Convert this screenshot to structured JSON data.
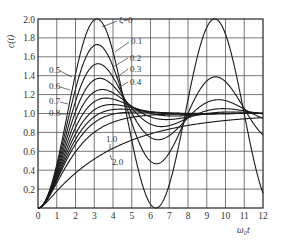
{
  "chart_data": {
    "type": "line",
    "title": "",
    "xlabel": "ω₀t",
    "ylabel": "c(t)",
    "xlim": [
      0,
      12
    ],
    "ylim": [
      0,
      2.0
    ],
    "grid": true,
    "xticks": [
      "0",
      "1",
      "2",
      "3",
      "4",
      "5",
      "6",
      "7",
      "8",
      "9",
      "10",
      "11",
      "12"
    ],
    "yticks": [
      "0.2",
      "0.4",
      "0.6",
      "0.8",
      "1.0",
      "1.2",
      "1.4",
      "1.6",
      "1.8",
      "2.0"
    ],
    "legend_position": "inline labels",
    "formula": "c(t) = 1 - e^(-ξω₀t)/sqrt(1-ξ²) · sin(ω₀·sqrt(1-ξ²)·t + arccos ξ)",
    "series": [
      {
        "name": "ξ=0",
        "zeta": 0.0,
        "label": "ξ=0"
      },
      {
        "name": "0.1",
        "zeta": 0.1,
        "label": "0.1"
      },
      {
        "name": "0.2",
        "zeta": 0.2,
        "label": "0.2"
      },
      {
        "name": "0.3",
        "zeta": 0.3,
        "label": "0.3"
      },
      {
        "name": "0.4",
        "zeta": 0.4,
        "label": "0.4"
      },
      {
        "name": "0.5",
        "zeta": 0.5,
        "label": "0.5"
      },
      {
        "name": "0.6",
        "zeta": 0.6,
        "label": "0.6"
      },
      {
        "name": "0.7",
        "zeta": 0.7,
        "label": "0.7"
      },
      {
        "name": "0.8",
        "zeta": 0.8,
        "label": "0.8"
      },
      {
        "name": "1.0",
        "zeta": 1.0,
        "label": "1.0"
      },
      {
        "name": "2.0",
        "zeta": 2.0,
        "label": "2.0"
      }
    ],
    "key_points": {
      "zeta_0_peak": [
        3.14,
        2.0
      ],
      "zeta_0_min": [
        6.28,
        0.0
      ],
      "zeta_0_second_peak": [
        9.42,
        2.0
      ],
      "zeta_0.1_peak": [
        3.16,
        1.73
      ],
      "zeta_0.2_peak": [
        3.21,
        1.53
      ],
      "zeta_0.3_peak": [
        3.29,
        1.37
      ],
      "zeta_0.4_peak": [
        3.43,
        1.25
      ],
      "zeta_0.5_peak": [
        3.63,
        1.16
      ]
    }
  },
  "labels": {
    "ylabel": "c(t)",
    "xlabel": "ω₀t"
  }
}
